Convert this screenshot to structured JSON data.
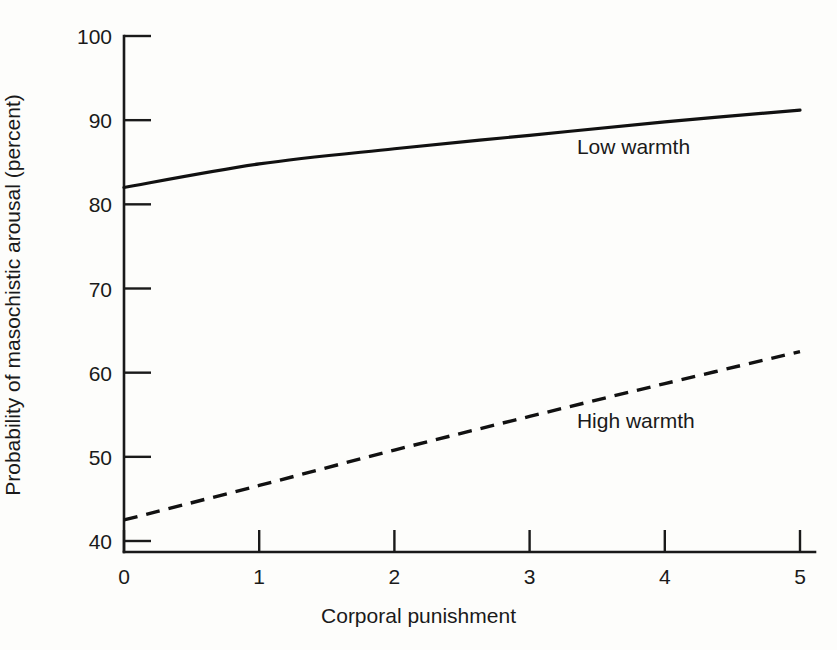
{
  "chart_data": {
    "type": "line",
    "title": "",
    "subtitle": "",
    "xlabel": "Corporal punishment",
    "ylabel": "Probability of masochistic arousal (percent)",
    "x": [
      0,
      1,
      2,
      3,
      4,
      5
    ],
    "xlim": [
      0,
      5
    ],
    "ylim": [
      40,
      100
    ],
    "xticks": [
      "0",
      "1",
      "2",
      "3",
      "4",
      "5"
    ],
    "yticks": [
      "40",
      "50",
      "60",
      "70",
      "80",
      "90",
      "100"
    ],
    "grid": false,
    "legend_position": "inline-annotation",
    "series": [
      {
        "name": "Low warmth",
        "style": "solid",
        "color": "#111111",
        "values": [
          82.0,
          84.8,
          86.6,
          88.2,
          89.8,
          91.2
        ],
        "label_x": 3.35,
        "label_y": 86.8
      },
      {
        "name": "High warmth",
        "style": "dashed",
        "color": "#111111",
        "values": [
          42.5,
          46.6,
          50.8,
          54.8,
          58.7,
          62.5
        ],
        "label_x": 3.35,
        "label_y": 54.2
      }
    ],
    "annotations": [
      {
        "text": "Low warmth",
        "x": 3.35,
        "y": 86.8
      },
      {
        "text": "High warmth",
        "x": 3.35,
        "y": 54.2
      }
    ]
  },
  "axes": {
    "y_tick_labels": [
      "100",
      "90",
      "80",
      "70",
      "60",
      "50",
      "40"
    ],
    "x_tick_labels": [
      "0",
      "1",
      "2",
      "3",
      "4",
      "5"
    ],
    "x_title": "Corporal punishment",
    "y_title": "Probability of masochistic arousal (percent)"
  },
  "labels": {
    "series_low": "Low warmth",
    "series_high": "High warmth"
  }
}
